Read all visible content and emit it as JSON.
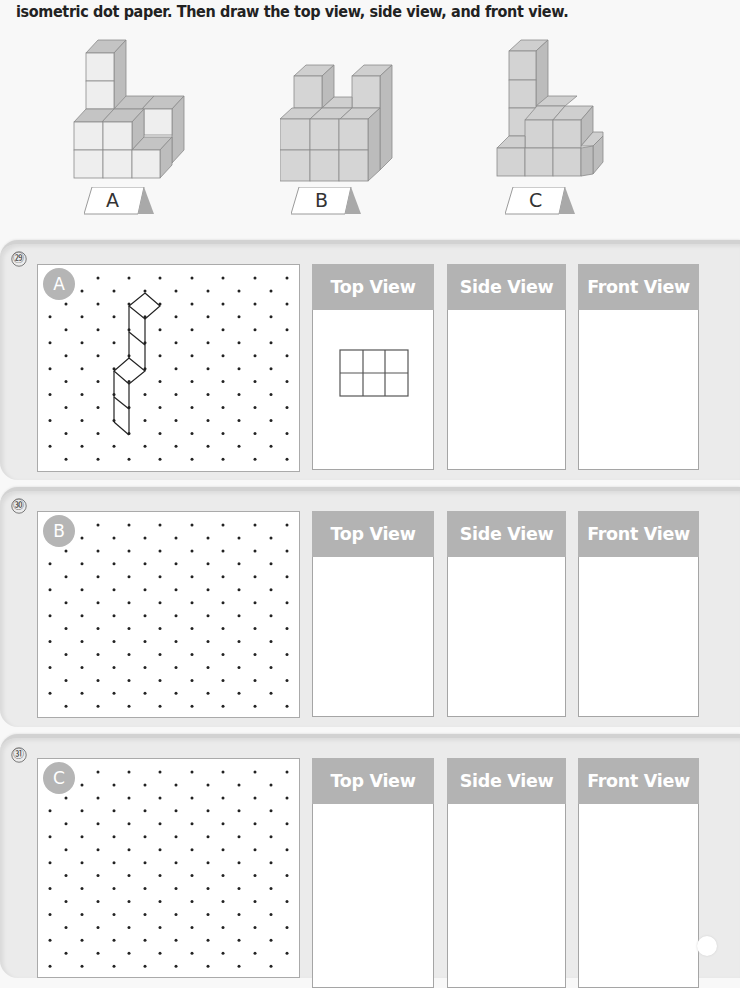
{
  "instruction": "isometric dot paper.  Then draw the top view, side view, and front view.",
  "figures": [
    {
      "label": "A",
      "name": "figure-a"
    },
    {
      "label": "B",
      "name": "figure-b"
    },
    {
      "label": "C",
      "name": "figure-c"
    }
  ],
  "questions": [
    {
      "number": "㉙",
      "figure_label": "A",
      "views": {
        "top": "Top View",
        "side": "Side View",
        "front": "Front View"
      },
      "top_view_sketch": {
        "cols": 3,
        "rows": 2
      }
    },
    {
      "number": "㉚",
      "figure_label": "B",
      "views": {
        "top": "Top View",
        "side": "Side View",
        "front": "Front View"
      }
    },
    {
      "number": "㉛",
      "figure_label": "C",
      "views": {
        "top": "Top View",
        "side": "Side View",
        "front": "Front View"
      }
    }
  ],
  "colors": {
    "header_gray": "#b3b3b3",
    "badge_gray": "#b5b5b5",
    "card_bg": "#ebebeb",
    "cube_face": "#e6e6e6",
    "cube_top": "#c9c9c9",
    "cube_side": "#b9b9b9"
  }
}
